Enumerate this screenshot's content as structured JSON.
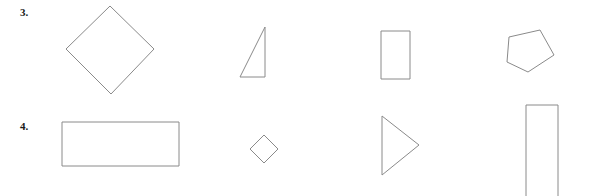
{
  "page": {
    "background_color": "#ffffff",
    "stroke_color": "#8a8a8a",
    "label_color": "#1b1b1b",
    "width": 589,
    "height": 196
  },
  "rows": [
    {
      "number": "3.",
      "label_x": 20,
      "label_y": 7,
      "shapes": [
        {
          "name": "rhombus-large",
          "kind": "polygon",
          "description": "large diamond / rhombus rotated square",
          "x": 62,
          "y": 2,
          "w": 96,
          "h": 98,
          "points": "48,4 92,47 49,92 4,47"
        },
        {
          "name": "right-triangle",
          "kind": "polygon",
          "description": "narrow right triangle, vertical leg on right",
          "x": 236,
          "y": 22,
          "w": 36,
          "h": 60,
          "points": "29,5 29,55 4,55"
        },
        {
          "name": "rectangle-portrait-small",
          "kind": "rect",
          "description": "small upright rectangle",
          "x": 377,
          "y": 26,
          "w": 40,
          "h": 58,
          "rx_x": 4,
          "rx_y": 5,
          "rx_w": 29,
          "rx_h": 48
        },
        {
          "name": "pentagon",
          "kind": "polygon",
          "description": "irregular tilted pentagon",
          "x": 502,
          "y": 25,
          "w": 60,
          "h": 54,
          "points": "38,5 52,30 26,47 5,37 7,12"
        }
      ]
    },
    {
      "number": "4.",
      "label_x": 20,
      "label_y": 121,
      "shapes": [
        {
          "name": "rectangle-landscape-large",
          "kind": "rect",
          "description": "wide landscape rectangle",
          "x": 57,
          "y": 117,
          "w": 128,
          "h": 55,
          "rx_x": 5,
          "rx_y": 5,
          "rx_w": 117,
          "rx_h": 44
        },
        {
          "name": "rhombus-small",
          "kind": "polygon",
          "description": "small diamond / rhombus",
          "x": 246,
          "y": 131,
          "w": 38,
          "h": 38,
          "points": "18,4 32,18 18,32 4,18"
        },
        {
          "name": "triangle-right-pointing",
          "kind": "polygon",
          "description": "triangle pointing right, vertical leg on left",
          "x": 377,
          "y": 112,
          "w": 48,
          "h": 68,
          "points": "5,4 42,33 5,63"
        },
        {
          "name": "rectangle-portrait-tall",
          "kind": "rect",
          "description": "tall narrow rectangle cropped at bottom edge",
          "x": 521,
          "y": 100,
          "w": 44,
          "h": 100,
          "rx_x": 5,
          "rx_y": 5,
          "rx_w": 32,
          "rx_h": 94
        }
      ]
    }
  ]
}
